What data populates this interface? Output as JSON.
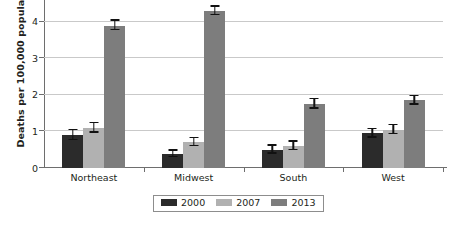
{
  "chart_data": {
    "type": "bar",
    "title": "",
    "xlabel": "",
    "ylabel": "Deaths per 100,000 population",
    "categories": [
      "Northeast",
      "Midwest",
      "South",
      "West"
    ],
    "ylim": [
      0,
      4.6
    ],
    "yticks": [
      0,
      1,
      2,
      3,
      4
    ],
    "ytick_labels": [
      "0",
      "1",
      "2",
      "3",
      "4"
    ],
    "grid": true,
    "legend_position": "bottom",
    "series": [
      {
        "name": "2000",
        "color": "#2b2b2b",
        "values": [
          0.9,
          0.38,
          0.5,
          0.95
        ],
        "errors": [
          0.13,
          0.09,
          0.11,
          0.12
        ]
      },
      {
        "name": "2007",
        "color": "#b1b1b1",
        "values": [
          1.1,
          0.7,
          0.6,
          1.05
        ],
        "errors": [
          0.13,
          0.11,
          0.12,
          0.13
        ]
      },
      {
        "name": "2013",
        "color": "#7d7d7d",
        "values": [
          3.9,
          4.3,
          1.75,
          1.85
        ],
        "errors": [
          0.13,
          0.12,
          0.13,
          0.12
        ]
      }
    ]
  },
  "axis": {
    "tick_0": "0",
    "tick_1": "1",
    "tick_2": "2",
    "tick_3": "3",
    "tick_4": "4"
  },
  "categories": {
    "c0": "Northeast",
    "c1": "Midwest",
    "c2": "South",
    "c3": "West"
  },
  "legend": {
    "item0": "2000",
    "item1": "2007",
    "item2": "2013"
  }
}
